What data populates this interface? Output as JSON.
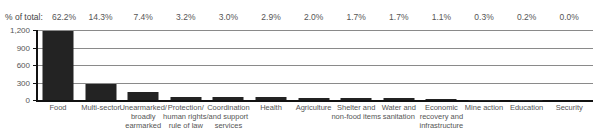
{
  "chart_data": {
    "type": "bar",
    "title": "",
    "xlabel": "",
    "ylabel": "",
    "ylim": [
      0,
      1200
    ],
    "yticks": [
      "0",
      "300",
      "600",
      "900",
      "1,200"
    ],
    "grid": true,
    "legend": null,
    "pct_header": "% of total:",
    "categories": [
      "Food",
      "Multi-sector",
      "Unearmarked/\nbroadly\nearmarked",
      "Protection/\nhuman rights/\nrule of law",
      "Coordination\nand support\nservices",
      "Health",
      "Agriculture",
      "Shelter and\nnon-food items",
      "Water and\nsanitation",
      "Economic\nrecovery and\ninfrastructure",
      "Mine action",
      "Education",
      "Security"
    ],
    "values": [
      1176,
      270,
      140,
      60,
      57,
      55,
      38,
      32,
      32,
      21,
      6,
      4,
      0
    ],
    "percent_of_total": [
      "62.2%",
      "14.3%",
      "7.4%",
      "3.2%",
      "3.0%",
      "2.9%",
      "2.0%",
      "1.7%",
      "1.7%",
      "1.1%",
      "0.3%",
      "0.2%",
      "0.0%"
    ],
    "colors": {
      "bar": "#232323",
      "grid": "#8a8a8a",
      "axis": "#111111"
    }
  }
}
